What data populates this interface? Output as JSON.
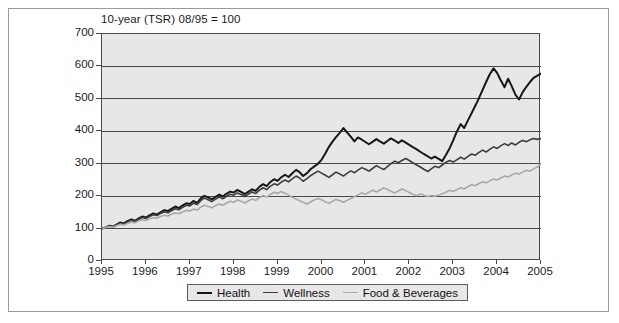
{
  "chart_data": {
    "type": "line",
    "title": "10-year (TSR) 08/95 = 100",
    "xlabel": "",
    "ylabel": "",
    "xlim": [
      1995,
      2005
    ],
    "ylim": [
      0,
      700
    ],
    "grid": true,
    "legend_position": "bottom-center",
    "ytick_labels": [
      "0",
      "100",
      "200",
      "300",
      "400",
      "500",
      "600",
      "700"
    ],
    "ytick_values": [
      0,
      100,
      200,
      300,
      400,
      500,
      600,
      700
    ],
    "xtick_labels": [
      "1995",
      "1996",
      "1997",
      "1998",
      "1999",
      "2000",
      "2001",
      "2002",
      "2003",
      "2004",
      "2005"
    ],
    "xtick_values": [
      1995,
      1996,
      1997,
      1998,
      1999,
      2000,
      2001,
      2002,
      2003,
      2004,
      2005
    ],
    "colors": {
      "health": "#161616",
      "wellness": "#3d3d3d",
      "food_beverages": "#a8a8a8",
      "plot_background": "#e7e7e7",
      "gridline": "#4a4a4a",
      "frame": "#9a9a9a"
    },
    "series": [
      {
        "name": "Health",
        "color": "#161616",
        "width": 2.0,
        "x": [
          1995.0,
          1995.08,
          1995.17,
          1995.25,
          1995.33,
          1995.42,
          1995.5,
          1995.58,
          1995.67,
          1995.75,
          1995.83,
          1995.92,
          1996.0,
          1996.08,
          1996.17,
          1996.25,
          1996.33,
          1996.42,
          1996.5,
          1996.58,
          1996.67,
          1996.75,
          1996.83,
          1996.92,
          1997.0,
          1997.08,
          1997.17,
          1997.25,
          1997.33,
          1997.42,
          1997.5,
          1997.58,
          1997.67,
          1997.75,
          1997.83,
          1997.92,
          1998.0,
          1998.08,
          1998.17,
          1998.25,
          1998.33,
          1998.42,
          1998.5,
          1998.58,
          1998.67,
          1998.75,
          1998.83,
          1998.92,
          1999.0,
          1999.08,
          1999.17,
          1999.25,
          1999.33,
          1999.42,
          1999.5,
          1999.58,
          1999.67,
          1999.75,
          1999.83,
          1999.92,
          2000.0,
          2000.08,
          2000.17,
          2000.25,
          2000.33,
          2000.42,
          2000.5,
          2000.58,
          2000.67,
          2000.75,
          2000.83,
          2000.92,
          2001.0,
          2001.08,
          2001.17,
          2001.25,
          2001.33,
          2001.42,
          2001.5,
          2001.58,
          2001.67,
          2001.75,
          2001.83,
          2001.92,
          2002.0,
          2002.08,
          2002.17,
          2002.25,
          2002.33,
          2002.42,
          2002.5,
          2002.58,
          2002.67,
          2002.75,
          2002.83,
          2002.92,
          2003.0,
          2003.08,
          2003.17,
          2003.25,
          2003.33,
          2003.42,
          2003.5,
          2003.58,
          2003.67,
          2003.75,
          2003.83,
          2003.92,
          2004.0,
          2004.08,
          2004.17,
          2004.25,
          2004.33,
          2004.42,
          2004.5,
          2004.58,
          2004.67,
          2004.75,
          2004.83,
          2004.92,
          2005.0
        ],
        "values": [
          100,
          103,
          109,
          106,
          112,
          119,
          116,
          123,
          128,
          124,
          131,
          137,
          134,
          141,
          147,
          143,
          150,
          157,
          154,
          161,
          168,
          163,
          171,
          178,
          176,
          185,
          179,
          193,
          201,
          196,
          190,
          197,
          205,
          199,
          207,
          214,
          211,
          219,
          213,
          206,
          213,
          221,
          216,
          228,
          237,
          231,
          243,
          252,
          247,
          258,
          266,
          259,
          270,
          281,
          274,
          262,
          271,
          283,
          291,
          300,
          312,
          330,
          352,
          368,
          382,
          396,
          410,
          397,
          383,
          369,
          381,
          374,
          367,
          360,
          368,
          376,
          369,
          362,
          370,
          378,
          371,
          364,
          372,
          365,
          358,
          351,
          344,
          337,
          330,
          323,
          316,
          322,
          315,
          308,
          326,
          348,
          372,
          398,
          422,
          410,
          432,
          456,
          478,
          500,
          528,
          552,
          575,
          594,
          580,
          558,
          536,
          562,
          540,
          512,
          498,
          520,
          538,
          552,
          565,
          572,
          578
        ]
      },
      {
        "name": "Wellness",
        "color": "#3d3d3d",
        "width": 1.6,
        "x": [
          1995.0,
          1995.08,
          1995.17,
          1995.25,
          1995.33,
          1995.42,
          1995.5,
          1995.58,
          1995.67,
          1995.75,
          1995.83,
          1995.92,
          1996.0,
          1996.08,
          1996.17,
          1996.25,
          1996.33,
          1996.42,
          1996.5,
          1996.58,
          1996.67,
          1996.75,
          1996.83,
          1996.92,
          1997.0,
          1997.08,
          1997.17,
          1997.25,
          1997.33,
          1997.42,
          1997.5,
          1997.58,
          1997.67,
          1997.75,
          1997.83,
          1997.92,
          1998.0,
          1998.08,
          1998.17,
          1998.25,
          1998.33,
          1998.42,
          1998.5,
          1998.58,
          1998.67,
          1998.75,
          1998.83,
          1998.92,
          1999.0,
          1999.08,
          1999.17,
          1999.25,
          1999.33,
          1999.42,
          1999.5,
          1999.58,
          1999.67,
          1999.75,
          1999.83,
          1999.92,
          2000.0,
          2000.08,
          2000.17,
          2000.25,
          2000.33,
          2000.42,
          2000.5,
          2000.58,
          2000.67,
          2000.75,
          2000.83,
          2000.92,
          2001.0,
          2001.08,
          2001.17,
          2001.25,
          2001.33,
          2001.42,
          2001.5,
          2001.58,
          2001.67,
          2001.75,
          2001.83,
          2001.92,
          2002.0,
          2002.08,
          2002.17,
          2002.25,
          2002.33,
          2002.42,
          2002.5,
          2002.58,
          2002.67,
          2002.75,
          2002.83,
          2002.92,
          2003.0,
          2003.08,
          2003.17,
          2003.25,
          2003.33,
          2003.42,
          2003.5,
          2003.58,
          2003.67,
          2003.75,
          2003.83,
          2003.92,
          2004.0,
          2004.08,
          2004.17,
          2004.25,
          2004.33,
          2004.42,
          2004.5,
          2004.58,
          2004.67,
          2004.75,
          2004.83,
          2004.92,
          2005.0
        ],
        "values": [
          100,
          104,
          108,
          105,
          111,
          117,
          114,
          120,
          126,
          122,
          128,
          134,
          131,
          137,
          143,
          140,
          146,
          152,
          149,
          155,
          161,
          158,
          165,
          172,
          170,
          178,
          174,
          186,
          194,
          189,
          183,
          190,
          197,
          192,
          199,
          206,
          203,
          210,
          205,
          199,
          206,
          213,
          208,
          218,
          226,
          220,
          230,
          238,
          234,
          243,
          250,
          244,
          253,
          262,
          256,
          246,
          254,
          263,
          270,
          277,
          271,
          265,
          258,
          266,
          274,
          268,
          262,
          270,
          278,
          272,
          280,
          288,
          283,
          277,
          286,
          294,
          288,
          282,
          291,
          300,
          308,
          303,
          310,
          316,
          310,
          303,
          296,
          290,
          283,
          276,
          284,
          292,
          288,
          296,
          304,
          310,
          305,
          312,
          320,
          314,
          322,
          330,
          326,
          334,
          342,
          336,
          344,
          352,
          347,
          355,
          362,
          356,
          364,
          358,
          366,
          372,
          368,
          374,
          378,
          375,
          378
        ]
      },
      {
        "name": "Food & Beverages",
        "color": "#a8a8a8",
        "width": 1.6,
        "x": [
          1995.0,
          1995.08,
          1995.17,
          1995.25,
          1995.33,
          1995.42,
          1995.5,
          1995.58,
          1995.67,
          1995.75,
          1995.83,
          1995.92,
          1996.0,
          1996.08,
          1996.17,
          1996.25,
          1996.33,
          1996.42,
          1996.5,
          1996.58,
          1996.67,
          1996.75,
          1996.83,
          1996.92,
          1997.0,
          1997.08,
          1997.17,
          1997.25,
          1997.33,
          1997.42,
          1997.5,
          1997.58,
          1997.67,
          1997.75,
          1997.83,
          1997.92,
          1998.0,
          1998.08,
          1998.17,
          1998.25,
          1998.33,
          1998.42,
          1998.5,
          1998.58,
          1998.67,
          1998.75,
          1998.83,
          1998.92,
          1999.0,
          1999.08,
          1999.17,
          1999.25,
          1999.33,
          1999.42,
          1999.5,
          1999.58,
          1999.67,
          1999.75,
          1999.83,
          1999.92,
          2000.0,
          2000.08,
          2000.17,
          2000.25,
          2000.33,
          2000.42,
          2000.5,
          2000.58,
          2000.67,
          2000.75,
          2000.83,
          2000.92,
          2001.0,
          2001.08,
          2001.17,
          2001.25,
          2001.33,
          2001.42,
          2001.5,
          2001.58,
          2001.67,
          2001.75,
          2001.83,
          2001.92,
          2002.0,
          2002.08,
          2002.17,
          2002.25,
          2002.33,
          2002.42,
          2002.5,
          2002.58,
          2002.67,
          2002.75,
          2002.83,
          2002.92,
          2003.0,
          2003.08,
          2003.17,
          2003.25,
          2003.33,
          2003.42,
          2003.5,
          2003.58,
          2003.67,
          2003.75,
          2003.83,
          2003.92,
          2004.0,
          2004.08,
          2004.17,
          2004.25,
          2004.33,
          2004.42,
          2004.5,
          2004.58,
          2004.67,
          2004.75,
          2004.83,
          2004.92,
          2005.0
        ],
        "values": [
          100,
          103,
          106,
          104,
          109,
          113,
          111,
          116,
          120,
          118,
          123,
          127,
          125,
          130,
          134,
          132,
          137,
          141,
          139,
          144,
          148,
          146,
          151,
          156,
          154,
          160,
          157,
          166,
          172,
          168,
          164,
          170,
          176,
          172,
          178,
          184,
          181,
          188,
          184,
          179,
          185,
          191,
          187,
          195,
          202,
          197,
          205,
          212,
          208,
          214,
          209,
          203,
          197,
          191,
          186,
          181,
          176,
          182,
          188,
          193,
          189,
          183,
          178,
          184,
          190,
          186,
          181,
          187,
          193,
          198,
          204,
          210,
          206,
          212,
          218,
          213,
          219,
          225,
          221,
          215,
          210,
          216,
          222,
          217,
          211,
          206,
          201,
          207,
          203,
          199,
          202,
          200,
          203,
          207,
          212,
          218,
          214,
          220,
          226,
          222,
          229,
          235,
          232,
          238,
          244,
          241,
          247,
          253,
          250,
          256,
          262,
          259,
          265,
          271,
          268,
          274,
          280,
          277,
          284,
          290,
          300
        ]
      }
    ],
    "legend": [
      {
        "label": "Health",
        "color": "#161616",
        "width": 2.4
      },
      {
        "label": "Wellness",
        "color": "#3d3d3d",
        "width": 1.8
      },
      {
        "label": "Food & Beverages",
        "color": "#a8a8a8",
        "width": 1.6
      }
    ]
  }
}
